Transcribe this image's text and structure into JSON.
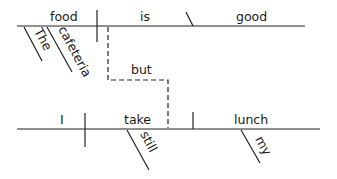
{
  "diagram": {
    "type": "sentence-diagram",
    "sentence": "The cafeteria food is good but I still take my lunch",
    "clause1": {
      "subject": "food",
      "verb": "is",
      "complement": "good",
      "modifiers": [
        "The",
        "cafeteria"
      ]
    },
    "conjunction": "but",
    "clause2": {
      "subject": "I",
      "verb": "take",
      "object": "lunch",
      "verb_modifiers": [
        "still"
      ],
      "object_modifiers": [
        "my"
      ]
    }
  }
}
